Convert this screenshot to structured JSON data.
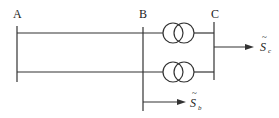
{
  "diagram": {
    "type": "power-system single-line diagram",
    "nodes": [
      {
        "id": "A",
        "label": "A"
      },
      {
        "id": "B",
        "label": "B"
      },
      {
        "id": "C",
        "label": "C"
      }
    ],
    "lines": [
      {
        "from": "A",
        "to": "B",
        "description": "upper parallel line"
      },
      {
        "from": "A",
        "to": "B",
        "description": "lower parallel line"
      }
    ],
    "transformers": [
      {
        "from": "B",
        "to": "C",
        "description": "upper two-winding transformer"
      },
      {
        "from": "B",
        "to": "C",
        "description": "lower two-winding transformer"
      }
    ],
    "loads": [
      {
        "at": "C",
        "symbol": "S",
        "tilde": "~",
        "subscript": "c"
      },
      {
        "at": "B",
        "symbol": "S",
        "tilde": "~",
        "subscript": "b"
      }
    ]
  },
  "colors": {
    "line": "#333333",
    "background": "#ffffff"
  }
}
